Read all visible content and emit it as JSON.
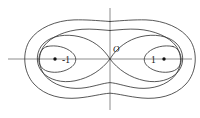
{
  "figure": {
    "name": "cassini-ovals-diagram",
    "type": "math-curve-plot",
    "background_color": "#ffffff",
    "curve_color": "#3a3a3a",
    "axis_color": "#808080",
    "label_color": "#111111"
  },
  "axes": {
    "x_axis": {
      "name": "horizontal-axis",
      "x1": 8,
      "y1": 59,
      "x2": 192,
      "y2": 59
    },
    "y_axis": {
      "name": "vertical-axis",
      "x1": 110,
      "y1": 8,
      "x2": 110,
      "y2": 110
    },
    "origin": {
      "x": 110,
      "y": 59
    }
  },
  "labels": {
    "origin": "O",
    "origin_pos": {
      "x": 113,
      "y": 52
    },
    "left_focus": "-1",
    "left_focus_label_pos": {
      "x": 62,
      "y": 63
    },
    "right_focus": "1",
    "right_focus_label_pos": {
      "x": 151,
      "y": 63
    }
  },
  "foci": [
    {
      "name": "left-focus-point",
      "value": "-1",
      "x": 55,
      "y": 59
    },
    {
      "name": "right-focus-point",
      "value": "1",
      "x": 164,
      "y": 59
    }
  ],
  "chart_data": {
    "type": "line",
    "title": "",
    "xlabel": "",
    "ylabel": "",
    "grid": false,
    "legend": "none",
    "series": [
      {
        "name": "outer-oval",
        "label": "outer Cassini oval (single connected curve)",
        "path": "M 110 21.5 C 96 20.5 86 19.6 74 19.9 C 56 20.4 38 28 30 40 C 22 52 23 72 34 84 C 45 96 62 99.5 78 98 C 92 96.7 101 93.8 110 93.2 C 119 93.8 128 96.7 142 98 C 158 99.5 175 96 186 84 C 197 72 198 52 190 40 C 182 28 164 20.4 146 19.9 C 134 19.6 124 20.5 110 21.5 Z"
      },
      {
        "name": "middle-oval",
        "label": "middle Cassini oval (single connected curve, waisted)",
        "path": "M 110 30.5 C 100 29.8 92 28.6 82 29.3 C 66 30.4 51 36.6 44 46 C 37 55.4 38 69.8 48 78.6 C 58 87.4 73 89.8 86 87.6 C 96 85.9 103 83.2 110 82.6 C 117 83.2 124 85.9 134 87.6 C 147 89.8 162 87.4 172 78.6 C 182 69.8 183 55.4 176 46 C 169 36.6 154 30.4 138 29.3 C 128 28.6 120 29.8 110 30.5 Z"
      },
      {
        "name": "lemniscate",
        "label": "lemniscate of Bernoulli (figure-eight through origin)",
        "path": "M 110 59 C 103 47.5 92 39.6 79 36.6 C 66 33.6 52 35.6 44 43 C 36 50.4 35 63.6 42 71.8 C 49 80 62 83.4 75 80.8 C 90 77.8 102 69.6 110 59 C 117 47.5 128 39.6 141 36.6 C 154 33.6 168 35.6 176 43 C 184 50.4 185 63.6 178 71.8 C 171 80 158 83.4 145 80.8 C 130 77.8 118 69.6 110 59 Z"
      },
      {
        "name": "left-inner-oval",
        "label": "left inner oval (ovoid around focus -1)",
        "path": "M 47 46.5 C 56 44.6 66 47 72 52.4 C 77 56.8 77 62.4 72 66.6 C 66 71.6 56 73.6 48 71.4 C 41 69.4 38 63.4 39 57.6 C 40 51.8 43 47.4 47 46.5 Z"
      },
      {
        "name": "right-inner-oval",
        "label": "right inner oval (ovoid around focus 1)",
        "path": "M 173 46.5 C 164 44.6 154 47 148 52.4 C 143 56.8 143 62.4 148 66.6 C 154 71.6 164 73.6 172 71.4 C 179 69.4 182 63.4 181 57.6 C 180 51.8 177 47.4 173 46.5 Z"
      }
    ]
  }
}
